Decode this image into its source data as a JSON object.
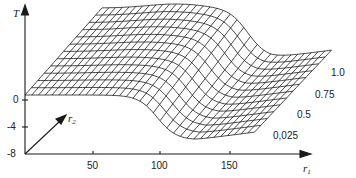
{
  "chart_data": {
    "type": "surface-wireframe",
    "title": "",
    "axes": {
      "z_label": "T",
      "x_label": "r",
      "x_label_sub": "1",
      "depth_label": "r",
      "depth_label_sub": "2"
    },
    "z_ticks": [
      "0",
      "-4",
      "-8"
    ],
    "x_ticks": [
      "50",
      "100",
      "150"
    ],
    "depth_ticks": [
      "0,025",
      "0.5",
      "0.75",
      "1.0"
    ],
    "z_range": [
      -8,
      8
    ],
    "x_range": [
      0,
      190
    ],
    "depth_range": [
      0,
      1
    ],
    "surface_description": "High plateau for small r1, sigmoid drop around r1 between 80 and 120, low valley then slight rise for large r1; the transition position shifts with r2",
    "profiles": [
      {
        "r2": 0.025,
        "r1": [
          0,
          50,
          80,
          100,
          115,
          150,
          180
        ],
        "T": [
          0,
          0,
          -1,
          -6,
          -8,
          -7,
          -6
        ]
      },
      {
        "r2": 0.5,
        "r1": [
          0,
          50,
          80,
          100,
          115,
          150,
          180
        ],
        "T": [
          5,
          6,
          5,
          -2,
          -5,
          -4,
          -3
        ]
      },
      {
        "r2": 0.75,
        "r1": [
          0,
          50,
          80,
          100,
          115,
          150,
          180
        ],
        "T": [
          6,
          7,
          6,
          0,
          -3,
          -2,
          -1
        ]
      },
      {
        "r2": 1.0,
        "r1": [
          0,
          50,
          80,
          100,
          115,
          150,
          180
        ],
        "T": [
          7,
          8,
          7,
          2,
          -1,
          0,
          0
        ]
      }
    ],
    "grid": false,
    "legend": null
  }
}
